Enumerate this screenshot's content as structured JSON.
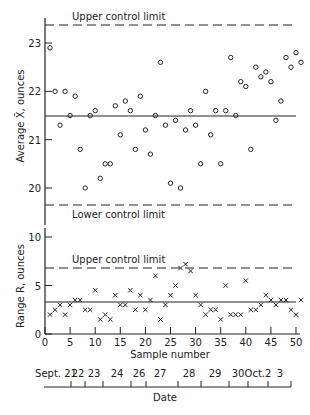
{
  "chart_data": [
    {
      "type": "scatter",
      "title": "",
      "ylabel": "Average X̄, ounces",
      "xlabel": "Sample number",
      "ylim": [
        19.5,
        23.5
      ],
      "yticks": [
        20,
        21,
        22,
        23
      ],
      "upper_control_limit": 23.37,
      "center_line": 21.5,
      "lower_control_limit": 19.65,
      "ucl_label": "Upper control limit",
      "lcl_label": "Lower control limit",
      "marker": "circle",
      "x": [
        1,
        2,
        3,
        4,
        5,
        6,
        7,
        8,
        9,
        10,
        11,
        12,
        13,
        14,
        15,
        16,
        17,
        18,
        19,
        20,
        21,
        22,
        23,
        24,
        25,
        26,
        27,
        28,
        29,
        30,
        31,
        32,
        33,
        34,
        35,
        36,
        37,
        38,
        39,
        40,
        41,
        42,
        43,
        44,
        45,
        46,
        47,
        48,
        49,
        50,
        51
      ],
      "values": [
        22.9,
        22.0,
        21.3,
        22.0,
        21.5,
        21.9,
        20.8,
        20.0,
        21.5,
        21.6,
        20.2,
        20.5,
        20.5,
        21.7,
        21.1,
        21.8,
        21.6,
        20.8,
        21.9,
        21.2,
        20.7,
        21.5,
        22.6,
        21.3,
        20.1,
        21.4,
        20.0,
        21.2,
        21.6,
        21.3,
        20.5,
        22.0,
        21.1,
        21.6,
        20.5,
        21.6,
        22.7,
        21.5,
        22.2,
        22.1,
        20.8,
        22.5,
        22.3,
        22.4,
        22.2,
        21.4,
        21.8,
        22.7,
        22.5,
        22.8,
        22.6
      ]
    },
    {
      "type": "scatter",
      "title": "",
      "ylabel": "Range R, ounces",
      "xlabel": "Sample number",
      "ylim": [
        0,
        10
      ],
      "yticks": [
        0,
        5,
        10
      ],
      "upper_control_limit": 6.8,
      "center_line": 3.3,
      "ucl_label": "Upper control limit",
      "marker": "x",
      "x": [
        1,
        2,
        3,
        4,
        5,
        6,
        7,
        8,
        9,
        10,
        11,
        12,
        13,
        14,
        15,
        16,
        17,
        18,
        19,
        20,
        21,
        22,
        23,
        24,
        25,
        26,
        27,
        28,
        29,
        30,
        31,
        32,
        33,
        34,
        35,
        36,
        37,
        38,
        39,
        40,
        41,
        42,
        43,
        44,
        45,
        46,
        47,
        48,
        49,
        50,
        51
      ],
      "values": [
        2.0,
        2.5,
        3.0,
        2.0,
        3.0,
        3.5,
        3.5,
        2.5,
        2.5,
        4.5,
        1.5,
        2.0,
        1.5,
        4.0,
        3.0,
        3.0,
        4.5,
        2.5,
        4.0,
        2.5,
        3.5,
        6.0,
        1.5,
        3.0,
        4.0,
        5.0,
        6.8,
        7.2,
        6.5,
        4.0,
        3.0,
        2.0,
        2.5,
        2.5,
        1.5,
        5.0,
        2.0,
        2.0,
        2.0,
        5.5,
        2.5,
        2.5,
        3.0,
        4.0,
        3.5,
        3.0,
        3.5,
        3.5,
        2.5,
        2.0,
        3.5
      ]
    }
  ],
  "axes": {
    "x_ticks": [
      0,
      5,
      10,
      15,
      20,
      25,
      30,
      35,
      40,
      45,
      50
    ],
    "x_label": "Sample number",
    "date_label": "Date",
    "date_ticks": [
      {
        "label": "Sept. 21",
        "x": 56
      },
      {
        "label": "22",
        "x": 78
      },
      {
        "label": "23",
        "x": 94
      },
      {
        "label": "24",
        "x": 117
      },
      {
        "label": "26",
        "x": 139
      },
      {
        "label": "27",
        "x": 160
      },
      {
        "label": "28",
        "x": 189
      },
      {
        "label": "29",
        "x": 215
      },
      {
        "label": "30",
        "x": 238
      },
      {
        "label": "Oct.2",
        "x": 258
      },
      {
        "label": "3",
        "x": 280
      }
    ],
    "date_tick_marks": [
      71,
      85,
      103,
      131,
      146,
      178,
      201,
      229,
      248,
      268,
      291
    ]
  }
}
